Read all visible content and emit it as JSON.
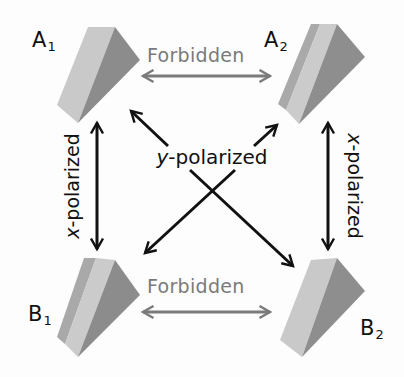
{
  "nodes": {
    "A1": {
      "letter": "A",
      "sub": "1"
    },
    "A2": {
      "letter": "A",
      "sub": "2"
    },
    "B1": {
      "letter": "B",
      "sub": "1"
    },
    "B2": {
      "letter": "B",
      "sub": "2"
    }
  },
  "transitions": {
    "top": {
      "label": "Forbidden",
      "from": "A1",
      "to": "A2"
    },
    "bottom": {
      "label": "Forbidden",
      "from": "B1",
      "to": "B2"
    },
    "left": {
      "label_axis": "x",
      "label_rest": "-polarized",
      "from": "A1",
      "to": "B1"
    },
    "right": {
      "label_axis": "x",
      "label_rest": "-polarized",
      "from": "A2",
      "to": "B2"
    },
    "diagonal": {
      "label_axis": "y",
      "label_rest": "-polarized",
      "pairs": [
        [
          "A1",
          "B2"
        ],
        [
          "A2",
          "B1"
        ]
      ]
    }
  },
  "colors": {
    "forbidden": "#7a7a7a",
    "allowed": "#111111",
    "prism_light": "#c9c9c9",
    "prism_mid": "#b2b2b2",
    "prism_dark": "#8a8a8a"
  }
}
